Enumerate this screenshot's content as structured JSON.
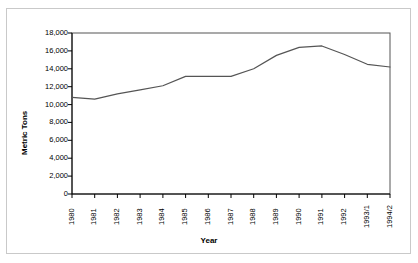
{
  "chart_data": {
    "type": "line",
    "title": "",
    "xlabel": "Year",
    "ylabel": "Metric Tons",
    "categories": [
      "1980",
      "1981",
      "1982",
      "1983",
      "1984",
      "1985",
      "1986",
      "1987",
      "1988",
      "1989",
      "1990",
      "1991",
      "1992",
      "1993/1",
      "1994/2"
    ],
    "values": [
      10800,
      10600,
      11200,
      11650,
      12100,
      13150,
      13150,
      13150,
      14000,
      15500,
      16400,
      16550,
      15600,
      14500,
      14200
    ],
    "ylim": [
      0,
      18000
    ],
    "ytick_labels": [
      "18,000",
      "16,000",
      "14,000",
      "12,000",
      "10,000",
      "8,000",
      "6,000",
      "4,000",
      "2,000",
      "0"
    ],
    "ytick_values": [
      18000,
      16000,
      14000,
      12000,
      10000,
      8000,
      6000,
      4000,
      2000,
      0
    ],
    "grid": false,
    "legend": false,
    "series_color": "#555555",
    "axis_color": "#000000",
    "frame_color": "#c9c9c9",
    "background": "#ffffff"
  }
}
